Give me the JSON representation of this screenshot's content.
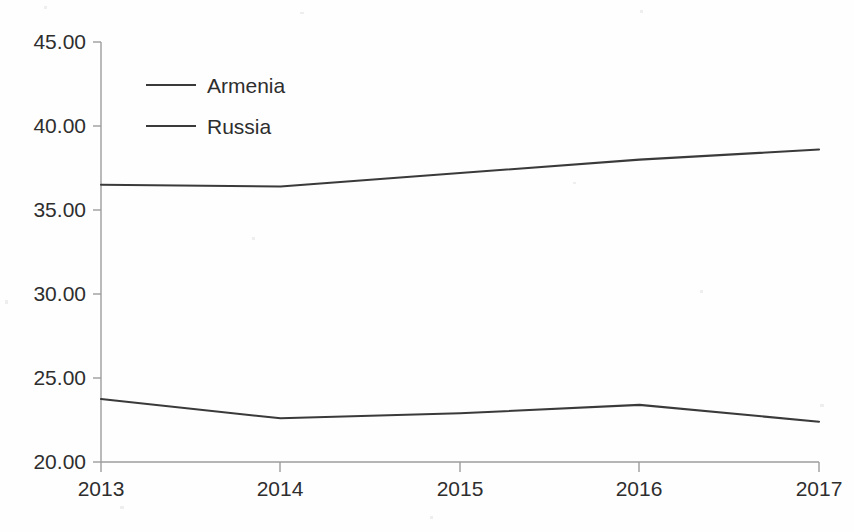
{
  "chart_data": {
    "type": "line",
    "title": "",
    "subtitle": "",
    "xlabel": "",
    "ylabel": "",
    "categories": [
      "2013",
      "2014",
      "2015",
      "2016",
      "2017"
    ],
    "x": [
      2013,
      2014,
      2015,
      2016,
      2017
    ],
    "series": [
      {
        "name": "Armenia",
        "values": [
          23.75,
          22.6,
          22.9,
          23.4,
          22.4
        ],
        "color": "#3a3a3a"
      },
      {
        "name": "Russia",
        "values": [
          36.5,
          36.4,
          37.2,
          38.0,
          38.6
        ],
        "color": "#3a3a3a"
      }
    ],
    "ylim": [
      20.0,
      45.0
    ],
    "yticks": [
      20.0,
      25.0,
      30.0,
      35.0,
      40.0,
      45.0
    ],
    "ytick_labels": [
      "20.00",
      "25.00",
      "30.00",
      "35.00",
      "40.00",
      "45.00"
    ],
    "xticks": [
      2013,
      2014,
      2015,
      2016,
      2017
    ],
    "xtick_labels": [
      "2013",
      "2014",
      "2015",
      "2016",
      "2017"
    ],
    "grid": false,
    "legend": {
      "position": "inside-top-left",
      "entries": [
        "Armenia",
        "Russia"
      ]
    }
  },
  "axis": {
    "y": {
      "labels": [
        {
          "text": "45.00",
          "value": 45.0
        },
        {
          "text": "40.00",
          "value": 40.0
        },
        {
          "text": "35.00",
          "value": 35.0
        },
        {
          "text": "30.00",
          "value": 30.0
        },
        {
          "text": "25.00",
          "value": 25.0
        },
        {
          "text": "20.00",
          "value": 20.0
        }
      ]
    },
    "x": {
      "labels": [
        {
          "text": "2013",
          "value": 2013
        },
        {
          "text": "2014",
          "value": 2014
        },
        {
          "text": "2015",
          "value": 2015
        },
        {
          "text": "2016",
          "value": 2016
        },
        {
          "text": "2017",
          "value": 2017
        }
      ]
    }
  },
  "legend": {
    "items": [
      {
        "label": "Armenia"
      },
      {
        "label": "Russia"
      }
    ]
  },
  "colors": {
    "background": "#fefefe",
    "axis": "#9d9d9d",
    "line": "#3a3a3a",
    "text": "#2e2e2e"
  }
}
